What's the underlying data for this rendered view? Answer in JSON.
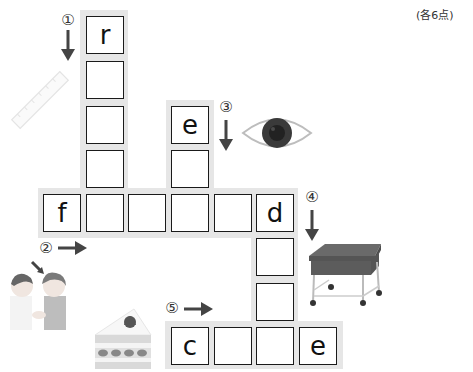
{
  "header": {
    "points_label": "(各6点)"
  },
  "clues": [
    {
      "number": "①",
      "direction": "down",
      "picture": "ruler",
      "first_letter": "r"
    },
    {
      "number": "②",
      "direction": "across",
      "picture": "friend",
      "first_letter": "f"
    },
    {
      "number": "③",
      "direction": "down",
      "picture": "eye",
      "first_letter": "e"
    },
    {
      "number": "④",
      "direction": "down",
      "picture": "desk",
      "first_letter": "d"
    },
    {
      "number": "⑤",
      "direction": "across",
      "picture": "cake",
      "first_letter": "c"
    }
  ],
  "grid": {
    "clue1": [
      "r",
      "",
      "",
      ""
    ],
    "clue2": [
      "f",
      "",
      "",
      "",
      "",
      "d"
    ],
    "clue3": [
      "e",
      ""
    ],
    "clue4": [
      "",
      ""
    ],
    "clue5": [
      "c",
      "",
      "",
      "e"
    ]
  },
  "colors": {
    "strip": "#e6e6e6",
    "border": "#1a1a1a",
    "arrow": "#444444"
  }
}
